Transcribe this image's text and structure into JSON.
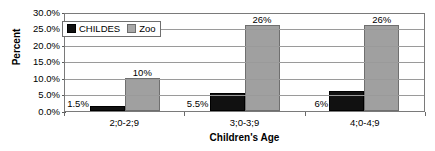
{
  "chart_data": {
    "type": "bar",
    "title": "",
    "xlabel": "Children's Age",
    "ylabel": "Percent",
    "categories": [
      "2;0-2;9",
      "3;0-3;9",
      "4;0-4;9"
    ],
    "series": [
      {
        "name": "CHILDES",
        "color": "#111111",
        "values": [
          1.5,
          5.5,
          6
        ],
        "labels": [
          "1.5%",
          "5.5%",
          "6%"
        ]
      },
      {
        "name": "Zoo",
        "color": "#a0a0a0",
        "values": [
          10,
          26,
          26
        ],
        "labels": [
          "10%",
          "26%",
          "26%"
        ]
      }
    ],
    "ylim": [
      0,
      30
    ],
    "ytick_step": 5,
    "ytick_labels": [
      "0.0%",
      "5.0%",
      "10.0%",
      "15.0%",
      "20.0%",
      "25.0%",
      "30.0%"
    ],
    "ytick_values": [
      0,
      5,
      10,
      15,
      20,
      25,
      30
    ],
    "grid": true,
    "legend_position": "top-left"
  },
  "legend": {
    "entries": [
      {
        "label": "CHILDES",
        "marker": "black-square-marker"
      },
      {
        "label": "Zoo",
        "marker": "gray-square-marker"
      }
    ]
  },
  "axes": {
    "y_title": "Percent",
    "x_title": "Children's Age"
  }
}
